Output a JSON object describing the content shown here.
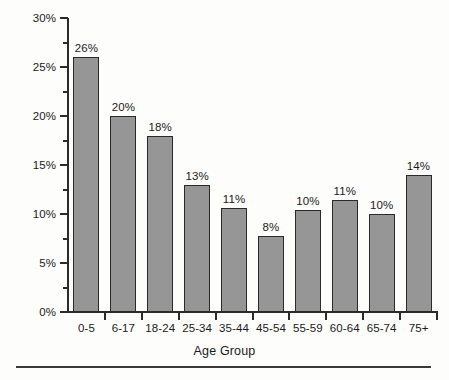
{
  "chart_data": {
    "type": "bar",
    "title": "",
    "xlabel": "Age Group",
    "ylabel": "Percent in Poverty",
    "categories": [
      "0-5",
      "6-17",
      "18-24",
      "25-34",
      "35-44",
      "45-54",
      "55-59",
      "60-64",
      "65-74",
      "75+"
    ],
    "values": [
      26,
      20,
      18,
      13,
      10.6,
      7.8,
      10.4,
      11.4,
      10,
      14
    ],
    "data_labels": [
      "26%",
      "20%",
      "18%",
      "13%",
      "11%",
      "8%",
      "10%",
      "11%",
      "10%",
      "14%"
    ],
    "ylim": [
      0,
      30
    ],
    "ytick_values": [
      0,
      5,
      10,
      15,
      20,
      25,
      30
    ],
    "ytick_labels": [
      "0%",
      "5%",
      "10%",
      "15%",
      "20%",
      "25%",
      "30%"
    ],
    "yminor_tick_values": [
      2.5,
      7.5,
      12.5,
      17.5,
      22.5,
      27.5
    ],
    "grid": false,
    "legend": false,
    "bar_color": "#969696",
    "bar_edge_color": "#2a2a2a",
    "axis_color": "#2b2b2b",
    "text_color": "#1a1a1a",
    "background_color": "#fdfdfc"
  },
  "footer": {
    "rule": true
  }
}
